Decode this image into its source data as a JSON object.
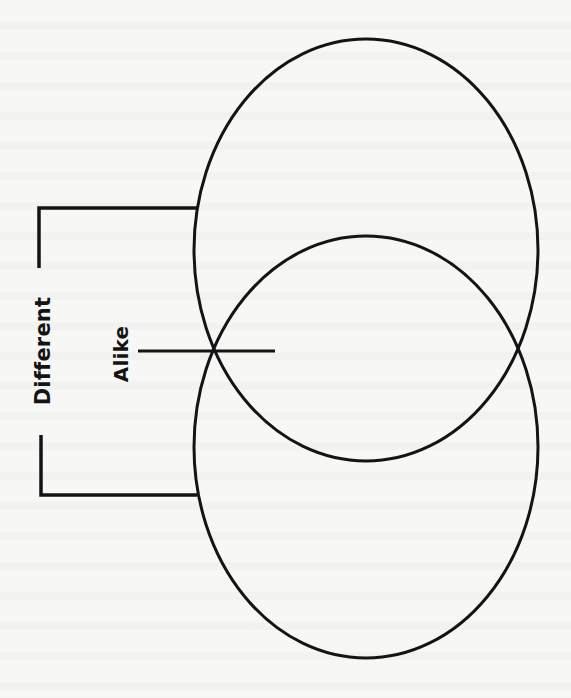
{
  "diagram": {
    "type": "venn-compare-contrast",
    "orientation": "vertical",
    "labels": {
      "different": "Different",
      "alike": "Alike"
    },
    "colors": {
      "stroke": "#141414",
      "background": "#f7f7f5"
    },
    "shapes": {
      "top_ellipse": {
        "cx": 366,
        "cy": 250,
        "rx": 172,
        "ry": 211
      },
      "bottom_ellipse": {
        "cx": 366,
        "cy": 447,
        "rx": 172,
        "ry": 211
      },
      "different_bracket_top": {
        "x1": 39,
        "y_top": 208,
        "x2": 197,
        "y_end": 268
      },
      "different_bracket_bottom": {
        "x1": 41,
        "y_start": 435,
        "x2": 197,
        "y_bottom": 495
      },
      "alike_line": {
        "x1": 138,
        "x2": 275,
        "y": 351
      }
    },
    "regions": [
      {
        "name": "top-only",
        "content": ""
      },
      {
        "name": "overlap",
        "content": ""
      },
      {
        "name": "bottom-only",
        "content": ""
      }
    ]
  }
}
